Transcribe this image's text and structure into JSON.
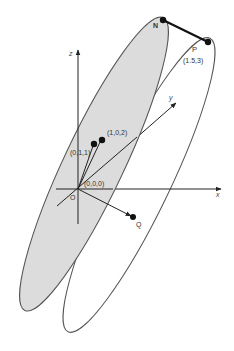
{
  "diagram": {
    "type": "3d-geometry",
    "colors": {
      "plane_fill": "#dcdcdc",
      "plane_stroke": "#555555",
      "axis": "#222222",
      "point": "#111111",
      "background": "#ffffff"
    },
    "axes": {
      "x_label": "x",
      "y_label": "y",
      "z_label": "z"
    },
    "points": [
      {
        "id": "N",
        "label": "N",
        "coords": ""
      },
      {
        "id": "P",
        "label": "P",
        "coords": "(1.5,3)"
      },
      {
        "id": "A",
        "label": "",
        "coords": "(1,0,2)"
      },
      {
        "id": "B",
        "label": "",
        "coords": "(0,1,1)"
      },
      {
        "id": "O",
        "label": "O",
        "coords": "(0,0,0)"
      },
      {
        "id": "Q",
        "label": "Q",
        "coords": ""
      }
    ],
    "planes": [
      {
        "name": "shaded-plane",
        "fill": "gray"
      },
      {
        "name": "outline-plane",
        "fill": "white"
      }
    ]
  }
}
